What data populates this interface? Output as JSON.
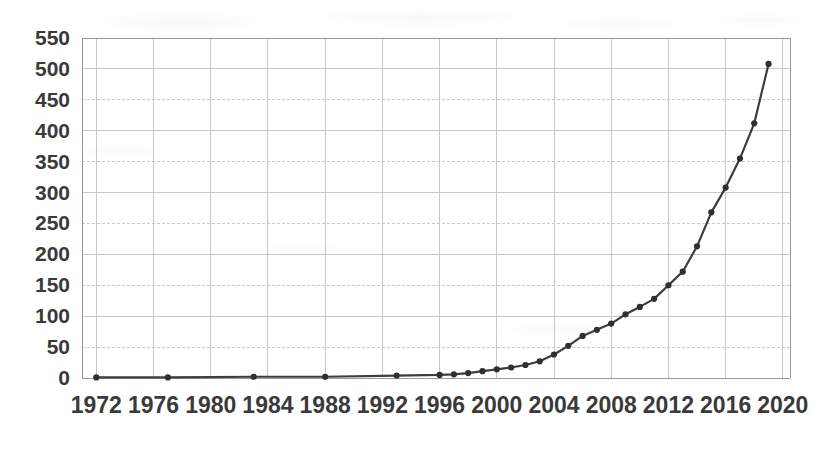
{
  "chart_data": {
    "type": "line",
    "title": "",
    "subtitle": "",
    "xlabel": "",
    "ylabel": "",
    "xlim": [
      1971,
      2020.5
    ],
    "ylim": [
      0,
      550
    ],
    "grid": true,
    "legend": null,
    "marker": "circle",
    "line_color": "#3d3d3d",
    "marker_color": "#2f2f2f",
    "grid_color": "#c8c8c8",
    "axis_color": "#9a9a9a",
    "text_color": "#3a3a3a",
    "background": "#ffffff",
    "ytick_labels": [
      "0",
      "50",
      "100",
      "150",
      "200",
      "250",
      "300",
      "350",
      "400",
      "450",
      "500",
      "550"
    ],
    "ytick_values": [
      0,
      50,
      100,
      150,
      200,
      250,
      300,
      350,
      400,
      450,
      500,
      550
    ],
    "xtick_labels": [
      "1972",
      "1976",
      "1980",
      "1984",
      "1988",
      "1992",
      "1996",
      "2000",
      "2004",
      "2008",
      "2012",
      "2016",
      "2020"
    ],
    "xtick_values": [
      1972,
      1976,
      1980,
      1984,
      1988,
      1992,
      1996,
      2000,
      2004,
      2008,
      2012,
      2016,
      2020
    ],
    "x": [
      1972,
      1977,
      1983,
      1988,
      1993,
      1996,
      1997,
      1998,
      1999,
      2000,
      2001,
      2002,
      2003,
      2004,
      2005,
      2006,
      2007,
      2008,
      2009,
      2010,
      2011,
      2012,
      2013,
      2014,
      2015,
      2016,
      2017,
      2018,
      2019
    ],
    "values": [
      1,
      1,
      2,
      2,
      4,
      5,
      6,
      8,
      11,
      14,
      17,
      21,
      27,
      38,
      52,
      68,
      78,
      88,
      103,
      115,
      128,
      150,
      172,
      213,
      268,
      308,
      355,
      412,
      508
    ],
    "points": [
      {
        "x": 1972,
        "y": 1
      },
      {
        "x": 1977,
        "y": 1
      },
      {
        "x": 1983,
        "y": 2
      },
      {
        "x": 1988,
        "y": 2
      },
      {
        "x": 1993,
        "y": 4
      },
      {
        "x": 1996,
        "y": 5
      },
      {
        "x": 1997,
        "y": 6
      },
      {
        "x": 1998,
        "y": 8
      },
      {
        "x": 1999,
        "y": 11
      },
      {
        "x": 2000,
        "y": 14
      },
      {
        "x": 2001,
        "y": 17
      },
      {
        "x": 2002,
        "y": 21
      },
      {
        "x": 2003,
        "y": 27
      },
      {
        "x": 2004,
        "y": 38
      },
      {
        "x": 2005,
        "y": 52
      },
      {
        "x": 2006,
        "y": 68
      },
      {
        "x": 2007,
        "y": 78
      },
      {
        "x": 2008,
        "y": 88
      },
      {
        "x": 2009,
        "y": 103
      },
      {
        "x": 2010,
        "y": 115
      },
      {
        "x": 2011,
        "y": 128
      },
      {
        "x": 2012,
        "y": 150
      },
      {
        "x": 2013,
        "y": 172
      },
      {
        "x": 2014,
        "y": 213
      },
      {
        "x": 2015,
        "y": 268
      },
      {
        "x": 2016,
        "y": 308
      },
      {
        "x": 2017,
        "y": 355
      },
      {
        "x": 2018,
        "y": 412
      },
      {
        "x": 2019,
        "y": 508
      }
    ]
  }
}
